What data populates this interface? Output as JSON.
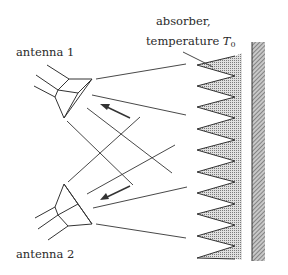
{
  "labels": {
    "absorber_line1": "absorber,",
    "absorber_line2": "temperature ",
    "temperature_symbol": "T",
    "temperature_subscript": "0",
    "antenna1": "antenna 1",
    "antenna2": "antenna 2"
  },
  "colors": {
    "line": "#333333",
    "absorber_fill": "#b8b8b8",
    "wall_fill": "#8a8a8a"
  },
  "absorber": {
    "tip_count": 10
  }
}
